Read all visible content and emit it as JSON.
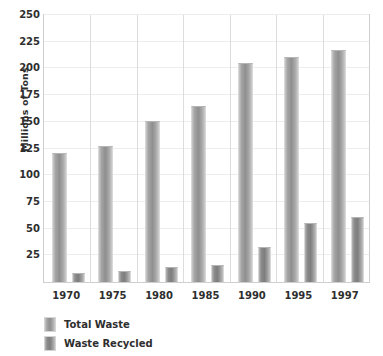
{
  "chart_data": {
    "type": "bar",
    "title": "",
    "xlabel": "",
    "ylabel": "Millions of Tons",
    "categories": [
      "1970",
      "1975",
      "1980",
      "1985",
      "1990",
      "1995",
      "1997"
    ],
    "series": [
      {
        "name": "Total Waste",
        "values": [
          121,
          127,
          151,
          165,
          205,
          211,
          217
        ],
        "color": "#8f8f8f"
      },
      {
        "name": "Waste Recycled",
        "values": [
          8,
          10,
          14,
          16,
          33,
          55,
          61
        ],
        "color": "#7e7e7e"
      }
    ],
    "ylim": [
      0,
      250
    ],
    "yticks": [
      250,
      225,
      200,
      175,
      150,
      125,
      100,
      75,
      50,
      25
    ],
    "ytick_labels": [
      "250",
      "225",
      "200",
      "175",
      "150",
      "125",
      "100",
      "75",
      "50",
      "25"
    ],
    "grid": true,
    "legend_position": "bottom-left"
  },
  "legend": {
    "items": [
      {
        "label": "Total Waste",
        "swatch": "total-waste-swatch"
      },
      {
        "label": "Waste Recycled",
        "swatch": "waste-recycled-swatch"
      }
    ]
  }
}
